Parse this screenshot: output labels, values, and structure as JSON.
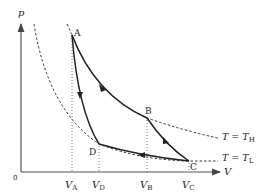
{
  "axes": {
    "y_label": "p",
    "x_label": "V",
    "origin_label": "0"
  },
  "points": [
    {
      "id": "A",
      "label": "A",
      "x": 72,
      "y": 35
    },
    {
      "id": "B",
      "label": "B",
      "x": 147,
      "y": 118
    },
    {
      "id": "C",
      "label": "C",
      "x": 189,
      "y": 161
    },
    {
      "id": "D",
      "label": "D",
      "x": 99,
      "y": 144
    }
  ],
  "volume_ticks": [
    {
      "main": "V",
      "sub": "A",
      "x": 72
    },
    {
      "main": "V",
      "sub": "D",
      "x": 99
    },
    {
      "main": "V",
      "sub": "B",
      "x": 147
    },
    {
      "main": "V",
      "sub": "C",
      "x": 189
    }
  ],
  "isotherms": [
    {
      "main": "T = T",
      "sub": "H"
    },
    {
      "main": "T = T",
      "sub": "L"
    }
  ],
  "colors": {
    "line": "#222222",
    "axis": "#555555",
    "dashed": "#333333",
    "dotted": "#666666"
  }
}
